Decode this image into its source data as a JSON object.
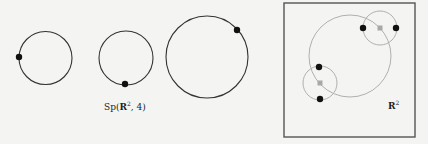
{
  "figure": {
    "width": 428,
    "height": 144,
    "background": "#f4f4f2",
    "colors": {
      "circle_stroke": "#333333",
      "light_circle_stroke": "#b0b0b0",
      "point": "#111111",
      "center_marker": "#a8a8a8",
      "box_stroke": "#555555"
    },
    "configurations": [
      {
        "id": "config-1",
        "circle": {
          "cx": 45.5,
          "cy": 58,
          "r": 26.5
        },
        "point": {
          "x": 19,
          "y": 57
        }
      },
      {
        "id": "config-2",
        "circle": {
          "cx": 126,
          "cy": 58,
          "r": 27
        },
        "point": {
          "x": 125,
          "y": 84
        }
      },
      {
        "id": "config-3",
        "circle": {
          "cx": 207,
          "cy": 57,
          "r": 41
        },
        "point": {
          "x": 237,
          "y": 30
        }
      }
    ],
    "space_label": {
      "text": "Sp(R², 4)",
      "main": "Sp(",
      "bold": "R",
      "sup": "2",
      "rest": ", 4)",
      "x": 104,
      "y": 110
    },
    "plane_panel": {
      "box": {
        "x": 284,
        "y": 3,
        "w": 131,
        "h": 134
      },
      "label": {
        "text": "R²",
        "bold": "R",
        "sup": "2",
        "x": 388,
        "y": 109
      },
      "big_circle": {
        "cx": 350,
        "cy": 56,
        "r": 41
      },
      "small_circles": [
        {
          "cx": 380,
          "cy": 28,
          "r": 17,
          "points": [
            {
              "x": 363,
              "y": 28
            },
            {
              "x": 396,
              "y": 28
            }
          ]
        },
        {
          "cx": 320,
          "cy": 83,
          "r": 17,
          "points": [
            {
              "x": 319,
              "y": 67
            },
            {
              "x": 320,
              "y": 99
            }
          ]
        }
      ]
    }
  }
}
